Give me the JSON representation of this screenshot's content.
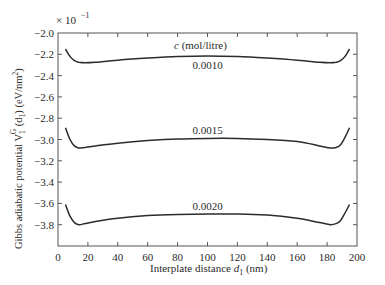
{
  "chart_data": {
    "type": "line",
    "title": "",
    "xlabel": "Interplate distance d1 (nm)",
    "ylabel": "Gibbs adiabatic potential V1G (d1) (eV/nm2)",
    "y_multiplier": "× 10^-1",
    "xlim": [
      0,
      200
    ],
    "ylim": [
      -4.0,
      -2.0
    ],
    "x_ticks": [
      0,
      20,
      40,
      60,
      80,
      100,
      120,
      140,
      160,
      180,
      200
    ],
    "y_ticks": [
      -2.0,
      -2.2,
      -2.4,
      -2.6,
      -2.8,
      -3.0,
      -3.2,
      -3.4,
      -3.6,
      -3.8
    ],
    "grid": false,
    "legend_title": "c (mol/litre)",
    "x": [
      5,
      8,
      11,
      14,
      18,
      25,
      40,
      60,
      80,
      100,
      120,
      140,
      160,
      175,
      182,
      186,
      189,
      192,
      195
    ],
    "series": [
      {
        "name": "0.0010",
        "label": "0.0010",
        "values": [
          -2.15,
          -2.22,
          -2.26,
          -2.275,
          -2.28,
          -2.275,
          -2.255,
          -2.235,
          -2.22,
          -2.215,
          -2.22,
          -2.235,
          -2.255,
          -2.275,
          -2.28,
          -2.275,
          -2.26,
          -2.22,
          -2.15
        ]
      },
      {
        "name": "0.0015",
        "label": "0.0015",
        "values": [
          -2.89,
          -3.0,
          -3.06,
          -3.08,
          -3.075,
          -3.06,
          -3.035,
          -3.01,
          -2.995,
          -2.99,
          -2.99,
          -3.0,
          -3.02,
          -3.06,
          -3.08,
          -3.075,
          -3.05,
          -2.98,
          -2.89
        ]
      },
      {
        "name": "0.0020",
        "label": "0.0020",
        "values": [
          -3.61,
          -3.72,
          -3.78,
          -3.8,
          -3.79,
          -3.77,
          -3.74,
          -3.715,
          -3.705,
          -3.7,
          -3.7,
          -3.71,
          -3.74,
          -3.78,
          -3.8,
          -3.79,
          -3.76,
          -3.69,
          -3.61
        ]
      }
    ]
  },
  "labels": {
    "multiplier_prefix": "× 10",
    "multiplier_exp": "−1",
    "legend_c": "c",
    "legend_units": " (mol/litre)",
    "xlabel_main": "Interplate distance ",
    "xlabel_var": "d",
    "xlabel_sub": "1",
    "xlabel_unit": " (nm)",
    "ylabel_main": "Gibbs adiabatic potential V",
    "ylabel_sub": "1",
    "ylabel_sup": "G",
    "ylabel_arg": " (d",
    "ylabel_arg_sub": "1",
    "ylabel_unit": ") (eV/nm",
    "ylabel_unit_sup": "2",
    "ylabel_close": ")"
  }
}
